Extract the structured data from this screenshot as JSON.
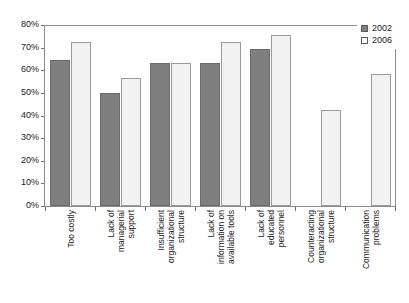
{
  "chart_data": {
    "type": "bar",
    "title": "",
    "subtitle": "",
    "xlabel": "",
    "ylabel": "",
    "ylim": [
      0,
      80
    ],
    "y_tick_labels": [
      "80%",
      "70%",
      "60%",
      "50%",
      "40%",
      "30%",
      "20%",
      "10%",
      "0%"
    ],
    "y_tick_values": [
      80,
      70,
      60,
      50,
      40,
      30,
      20,
      10,
      0
    ],
    "grid": false,
    "legend_position": "top-right",
    "categories": [
      "Too costly",
      "Lack of managerial support",
      "Insufficient organizational structure",
      "Lack of information on available tools",
      "Lack of educated personnel",
      "Counteracting organizational structure",
      "Communication problems"
    ],
    "category_label_lines": [
      [
        "Too costly"
      ],
      [
        "Lack of",
        "managerial",
        "support"
      ],
      [
        "Insufficient",
        "organizational",
        "structure"
      ],
      [
        "Lack of",
        "information on",
        "available tools"
      ],
      [
        "Lack of",
        "educated",
        "personnel"
      ],
      [
        "Counteracting",
        "organizational",
        "structure"
      ],
      [
        "Communication",
        "problems"
      ]
    ],
    "series": [
      {
        "name": "2002",
        "color": "#7f7f7f",
        "values": [
          64.5,
          50,
          63,
          63,
          69.5,
          null,
          null
        ]
      },
      {
        "name": "2006",
        "color": "#f2f2f2",
        "values": [
          72.5,
          56.5,
          63,
          72.5,
          75.5,
          42.5,
          58.5
        ]
      }
    ]
  },
  "legend": {
    "entries": [
      {
        "label": "2002"
      },
      {
        "label": "2006"
      }
    ]
  }
}
